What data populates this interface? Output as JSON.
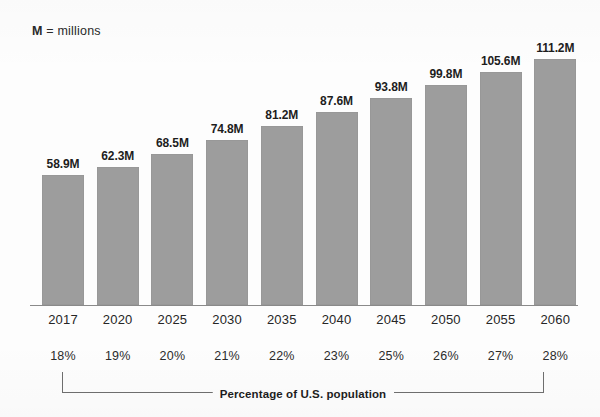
{
  "annotations": {
    "unit_key": "M",
    "unit_note": "= millions",
    "bracket_caption": "Percentage of U.S. population"
  },
  "chart_data": {
    "type": "bar",
    "title": "",
    "subtitle": "",
    "xlabel": "",
    "ylabel": "",
    "ylim": [
      0,
      120
    ],
    "grid": false,
    "legend": "none",
    "bar_color": "#9d9d9d",
    "axis_color": "#8a8a8a",
    "categories": [
      "2017",
      "2020",
      "2025",
      "2030",
      "2035",
      "2040",
      "2045",
      "2050",
      "2055",
      "2060"
    ],
    "values": [
      58.9,
      62.3,
      68.5,
      74.8,
      81.2,
      87.6,
      93.8,
      99.8,
      105.6,
      111.2
    ],
    "value_labels": [
      "58.9M",
      "62.3M",
      "68.5M",
      "74.8M",
      "81.2M",
      "87.6M",
      "93.8M",
      "99.8M",
      "105.6M",
      "111.2M"
    ],
    "secondary_axis_label": "Percentage of U.S. population",
    "secondary_values": [
      "18%",
      "19%",
      "20%",
      "21%",
      "22%",
      "23%",
      "25%",
      "26%",
      "27%",
      "28%"
    ]
  }
}
